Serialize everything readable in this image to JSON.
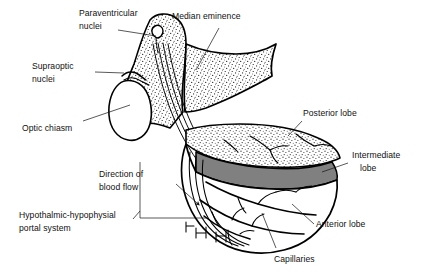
{
  "figure": {
    "background_color": "#ffffff",
    "ink_color": "#000000",
    "intermediate_lobe_fill": "#808080",
    "hypothalamus_texture": "stipple"
  },
  "labels": [
    {
      "id": "paraventricular-nuclei",
      "line1": "Paraventricular",
      "line2": "nuclei"
    },
    {
      "id": "median-eminence",
      "line1": "Median eminence",
      "line2": ""
    },
    {
      "id": "supraoptic-nuclei",
      "line1": "Supraoptic",
      "line2": "nuclei"
    },
    {
      "id": "optic-chiasm",
      "line1": "Optic chiasm",
      "line2": ""
    },
    {
      "id": "posterior-lobe",
      "line1": "Posterior lobe",
      "line2": ""
    },
    {
      "id": "intermediate-lobe",
      "line1": "Intermediate",
      "line2": "lobe"
    },
    {
      "id": "direction-of-blood-flow",
      "line1": "Direction of",
      "line2": "blood flow"
    },
    {
      "id": "hypothalamic-hypophysial-portal-system",
      "line1": "Hypothalmic-hypophysial",
      "line2": "portal system"
    },
    {
      "id": "anterior-lobe",
      "line1": "Anterior lobe",
      "line2": ""
    },
    {
      "id": "capillaries",
      "line1": "Capillaries",
      "line2": ""
    }
  ]
}
